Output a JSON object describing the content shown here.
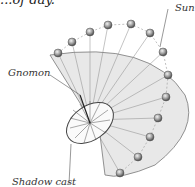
{
  "diagram": {
    "title_fragment": "...of day.",
    "labels": {
      "sun": "Sun",
      "gnomon": "Gnomon",
      "shadow": "Shadow cast"
    },
    "colors": {
      "plane": "#e6e6e6",
      "sun": "#9a9a9a",
      "lines": "#666666"
    }
  }
}
